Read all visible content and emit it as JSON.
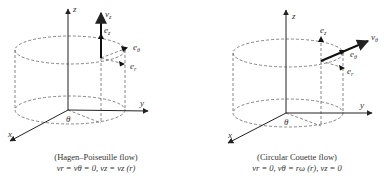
{
  "diagrams": [
    {
      "id": "left",
      "axes": {
        "x": "x",
        "y": "y",
        "z": "z",
        "angle": "θ"
      },
      "velocity_label": "v",
      "velocity_sub": "z",
      "unit_vectors": [
        {
          "base": "e",
          "sub": "z"
        },
        {
          "base": "e",
          "sub": "θ"
        },
        {
          "base": "e",
          "sub": "r"
        }
      ],
      "caption_title": "(Hagen–Poiseuille flow)",
      "caption_equation": "vr = vθ = 0, vz = vz (r)"
    },
    {
      "id": "right",
      "axes": {
        "x": "x",
        "y": "y",
        "z": "z",
        "angle": "θ"
      },
      "velocity_label": "v",
      "velocity_sub": "θ",
      "unit_vectors": [
        {
          "base": "e",
          "sub": "z"
        },
        {
          "base": "e",
          "sub": "θ"
        },
        {
          "base": "e",
          "sub": "r"
        }
      ],
      "caption_title": "(Circular Couette flow)",
      "caption_equation": "vr = 0, vθ = rω (r), vz = 0"
    }
  ],
  "colors": {
    "line": "#222222",
    "dashed": "#555555",
    "text": "#333333",
    "background": "#ffffff"
  }
}
